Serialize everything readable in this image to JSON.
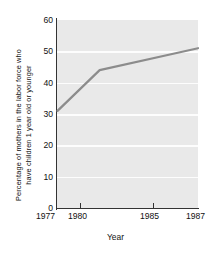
{
  "chart_data": {
    "type": "line",
    "title": "",
    "xlabel": "Year",
    "ylabel": "Percentage of mothers in the labor force who have children 1 year old or younger",
    "ylabel_lines": [
      "Percentage of mothers in the labor force who",
      "have children 1 year old or younger"
    ],
    "x": [
      1977,
      1980,
      1985,
      1987
    ],
    "values": [
      31,
      44,
      49,
      51
    ],
    "xlim": [
      1977,
      1987
    ],
    "ylim": [
      0,
      60
    ],
    "yticks": [
      60,
      50,
      40,
      30,
      20,
      10,
      0
    ],
    "ytick_labels": [
      "60",
      "50",
      "40",
      "30",
      "20",
      "10",
      "0"
    ],
    "xticks": [
      1977,
      1980,
      1985,
      1987
    ],
    "xtick_labels": [
      "1977",
      "1980",
      "1985",
      "1987"
    ],
    "xtick_marks": [
      1980,
      1985
    ],
    "grid": "horizontal",
    "legend": "none",
    "series": [
      {
        "name": "Percentage of mothers in the labor force with children 1 year old or younger",
        "x": [
          1977,
          1980,
          1985,
          1987
        ],
        "values": [
          31,
          44,
          49,
          51
        ]
      }
    ],
    "colors": {
      "line": "#8c8c8c",
      "plot_background": "#e9e9e9",
      "gridline": "#fdfdfd",
      "axis": "#333333",
      "text": "#111111",
      "figure_background": "#ffffff"
    }
  }
}
